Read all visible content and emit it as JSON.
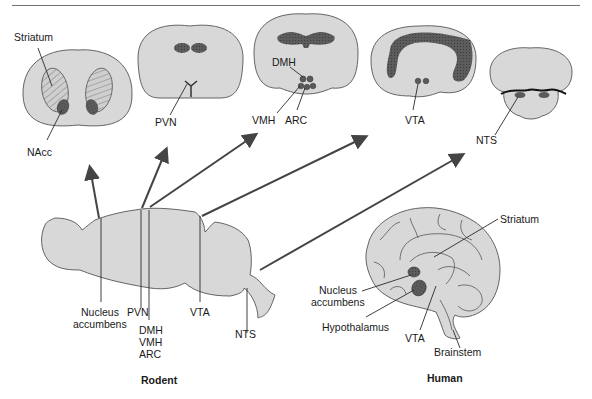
{
  "figure": {
    "sections": {
      "striatum_section": {
        "labels": {
          "striatum": "Striatum",
          "nacc": "NAcc"
        }
      },
      "pvn_section": {
        "labels": {
          "pvn": "PVN"
        }
      },
      "hypothalamus_section": {
        "labels": {
          "dmh": "DMH",
          "vmh": "VMH",
          "arc": "ARC"
        }
      },
      "vta_section": {
        "labels": {
          "vta": "VTA"
        }
      },
      "nts_section": {
        "labels": {
          "nts": "NTS"
        }
      }
    },
    "rodent": {
      "caption": "Rodent",
      "labels": {
        "nucleus_accumbens_line1": "Nucleus",
        "nucleus_accumbens_line2": "accumbens",
        "pvn": "PVN",
        "dmh": "DMH",
        "vmh": "VMH",
        "arc": "ARC",
        "vta": "VTA",
        "nts": "NTS"
      }
    },
    "human": {
      "caption": "Human",
      "labels": {
        "striatum": "Striatum",
        "nucleus_accumbens_line1": "Nucleus",
        "nucleus_accumbens_line2": "accumbens",
        "hypothalamus": "Hypothalamus",
        "vta": "VTA",
        "brainstem": "Brainstem"
      }
    },
    "colors": {
      "tissue": "#d8d8d8",
      "nucleus_dark": "#5a5a5a",
      "line": "#2a2a2a"
    }
  }
}
